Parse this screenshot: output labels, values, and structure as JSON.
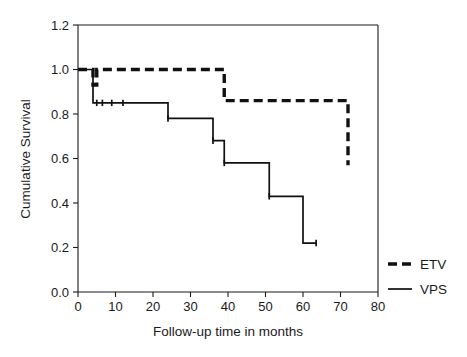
{
  "chart_data": {
    "type": "line",
    "title": "",
    "xlabel": "Follow-up time in months",
    "ylabel": "Cumulative Survival",
    "xlim": [
      0,
      80
    ],
    "ylim": [
      0,
      1.2
    ],
    "xticks": [
      0,
      10,
      20,
      30,
      40,
      50,
      60,
      70,
      80
    ],
    "xtick_labels": [
      "0",
      "10",
      "20",
      "30",
      "40",
      "50",
      "60",
      "70",
      "80"
    ],
    "yticks": [
      0.0,
      0.2,
      0.4,
      0.6,
      0.8,
      1.0,
      1.2
    ],
    "ytick_labels": [
      "0.0",
      "0.2",
      "0.4",
      "0.6",
      "0.8",
      "1.0",
      "1.2"
    ],
    "grid": false,
    "legend_position": "right-outside",
    "series": [
      {
        "name": "ETV",
        "style": "dashed",
        "color": "#111111",
        "steps": [
          {
            "x": 0,
            "y": 1.0
          },
          {
            "x": 4,
            "y": 1.0
          },
          {
            "x": 4,
            "y": 0.93
          },
          {
            "x": 5,
            "y": 0.93
          },
          {
            "x": 5,
            "y": 1.0
          },
          {
            "x": 39,
            "y": 1.0
          },
          {
            "x": 39,
            "y": 0.86
          },
          {
            "x": 72,
            "y": 0.86
          },
          {
            "x": 72,
            "y": 0.57
          }
        ],
        "censor_marks": []
      },
      {
        "name": "VPS",
        "style": "solid",
        "color": "#111111",
        "steps": [
          {
            "x": 0,
            "y": 1.0
          },
          {
            "x": 4,
            "y": 1.0
          },
          {
            "x": 4,
            "y": 0.85
          },
          {
            "x": 24,
            "y": 0.85
          },
          {
            "x": 24,
            "y": 0.78
          },
          {
            "x": 36,
            "y": 0.78
          },
          {
            "x": 36,
            "y": 0.68
          },
          {
            "x": 39,
            "y": 0.68
          },
          {
            "x": 39,
            "y": 0.58
          },
          {
            "x": 51,
            "y": 0.58
          },
          {
            "x": 51,
            "y": 0.43
          },
          {
            "x": 60,
            "y": 0.43
          },
          {
            "x": 60,
            "y": 0.22
          },
          {
            "x": 63.5,
            "y": 0.22
          }
        ],
        "censor_marks": [
          {
            "x": 5.0,
            "y": 0.85
          },
          {
            "x": 6.5,
            "y": 0.85
          },
          {
            "x": 9.0,
            "y": 0.85
          },
          {
            "x": 12.0,
            "y": 0.85
          },
          {
            "x": 24.0,
            "y": 0.78
          },
          {
            "x": 36.0,
            "y": 0.68
          },
          {
            "x": 39.0,
            "y": 0.58
          },
          {
            "x": 51.0,
            "y": 0.43
          },
          {
            "x": 63.5,
            "y": 0.22
          }
        ]
      }
    ],
    "legend": [
      {
        "label": "ETV",
        "style": "dashed"
      },
      {
        "label": "VPS",
        "style": "solid"
      }
    ]
  }
}
